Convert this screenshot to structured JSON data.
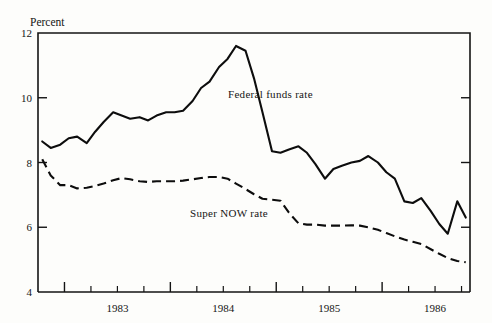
{
  "figure": {
    "unit_label": "Percent",
    "background_color": "#fdfdfb",
    "ink_color": "#0d0d0d"
  },
  "annotations": {
    "federal_funds": "Federal funds rate",
    "super_now": "Super NOW rate"
  },
  "axes": {
    "y_ticks": [
      "12",
      "10",
      "8",
      "6",
      "4"
    ],
    "x_ticks": [
      "1983",
      "1984",
      "1985",
      "1986"
    ]
  },
  "chart_data": {
    "type": "line",
    "title": "",
    "xlabel": "",
    "ylabel": "Percent",
    "ylim": [
      4,
      12
    ],
    "xlim": [
      1982.75,
      1986.83
    ],
    "grid": false,
    "legend": "inline-annotations",
    "y_ticks": [
      12,
      10,
      8,
      6,
      4
    ],
    "x_tick_labels": [
      "1983",
      "1984",
      "1985",
      "1986"
    ],
    "x_tick_positions": [
      1983.0,
      1984.0,
      1985.0,
      1986.0
    ],
    "x_minor_tick_interval": 0.25,
    "x": [
      1982.79,
      1982.87,
      1982.96,
      1983.04,
      1983.12,
      1983.21,
      1983.29,
      1983.37,
      1983.46,
      1983.54,
      1983.62,
      1983.71,
      1983.79,
      1983.87,
      1983.96,
      1984.04,
      1984.12,
      1984.21,
      1984.29,
      1984.37,
      1984.46,
      1984.54,
      1984.62,
      1984.71,
      1984.79,
      1984.87,
      1984.96,
      1985.04,
      1985.12,
      1985.21,
      1985.29,
      1985.37,
      1985.46,
      1985.54,
      1985.62,
      1985.71,
      1985.79,
      1985.87,
      1985.96,
      1986.04,
      1986.12,
      1986.21,
      1986.29,
      1986.37,
      1986.46,
      1986.54,
      1986.62,
      1986.71,
      1986.79
    ],
    "series": [
      {
        "name": "Federal funds rate",
        "style": "solid",
        "values": [
          8.65,
          8.45,
          8.55,
          8.75,
          8.8,
          8.6,
          8.95,
          9.25,
          9.55,
          9.45,
          9.35,
          9.4,
          9.3,
          9.45,
          9.55,
          9.55,
          9.6,
          9.9,
          10.3,
          10.5,
          10.95,
          11.2,
          11.6,
          11.45,
          10.6,
          9.55,
          8.35,
          8.3,
          8.4,
          8.5,
          8.3,
          7.95,
          7.5,
          7.8,
          7.9,
          8.0,
          8.05,
          8.2,
          8.0,
          7.7,
          7.5,
          6.8,
          6.75,
          6.9,
          6.5,
          6.1,
          5.8,
          6.8,
          6.3
        ]
      },
      {
        "name": "Super NOW rate",
        "style": "dashed",
        "values": [
          8.1,
          7.6,
          7.3,
          7.3,
          7.2,
          7.22,
          7.28,
          7.35,
          7.45,
          7.52,
          7.48,
          7.42,
          7.4,
          7.42,
          7.42,
          7.42,
          7.44,
          7.48,
          7.52,
          7.55,
          7.55,
          7.5,
          7.35,
          7.18,
          7.02,
          6.88,
          6.85,
          6.82,
          6.45,
          6.12,
          6.08,
          6.08,
          6.05,
          6.05,
          6.05,
          6.06,
          6.05,
          6.0,
          5.92,
          5.82,
          5.72,
          5.62,
          5.55,
          5.48,
          5.32,
          5.18,
          5.05,
          4.96,
          4.92
        ]
      }
    ]
  }
}
